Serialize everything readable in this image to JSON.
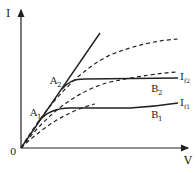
{
  "diagram": {
    "axes": {
      "y_label": "I",
      "x_label": "V",
      "origin_label": "0"
    },
    "points": {
      "A1": {
        "label": "A",
        "sub": "1"
      },
      "A2": {
        "label": "A",
        "sub": "2"
      },
      "B1": {
        "label": "B",
        "sub": "1"
      },
      "B2": {
        "label": "B",
        "sub": "2"
      }
    },
    "curve_labels": {
      "If1": {
        "label": "I",
        "sub": "f1"
      },
      "If2": {
        "label": "I",
        "sub": "f2"
      }
    },
    "colors": {
      "line": "#222222",
      "background": "#ffffff"
    }
  }
}
